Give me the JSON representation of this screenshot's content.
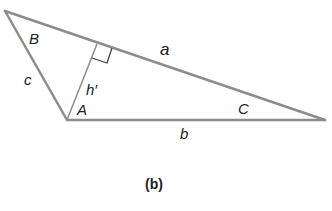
{
  "diagram": {
    "type": "triangle",
    "caption": "(b)",
    "vertices": {
      "B": [
        5,
        11
      ],
      "A": [
        67,
        120
      ],
      "C": [
        325,
        120
      ]
    },
    "altitude_foot": [
      97,
      44
    ],
    "labels": {
      "angle_B": "B",
      "angle_A": "A",
      "angle_C": "C",
      "side_a": "a",
      "side_b": "b",
      "side_c": "c",
      "altitude": "h′"
    },
    "line_color": "#8c8c8c",
    "text_color": "#222222"
  }
}
